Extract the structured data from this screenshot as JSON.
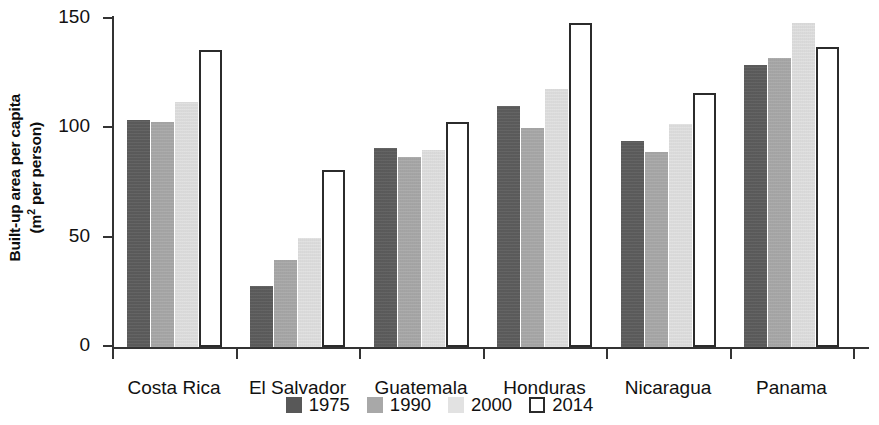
{
  "chart_data": {
    "type": "bar",
    "title": "",
    "subtitle": "",
    "xlabel": "",
    "ylabel": "Built-up area per capita (m² per person)",
    "ylabel_line1": "Built-up area per capita",
    "ylabel_line2_prefix": "(m",
    "ylabel_line2_sup": "2",
    "ylabel_line2_suffix": " per person)",
    "ylim": [
      0,
      150
    ],
    "yticks": [
      0,
      50,
      100,
      150
    ],
    "ytick_labels": [
      "0",
      "50",
      "100",
      "150"
    ],
    "grid": false,
    "legend_position": "bottom-center",
    "categories": [
      "Costa Rica",
      "El Salvador",
      "Guatemala",
      "Honduras",
      "Nicaragua",
      "Panama"
    ],
    "series": [
      {
        "name": "1975",
        "color": "#585858",
        "values": [
          104,
          28,
          91,
          110,
          94,
          129
        ]
      },
      {
        "name": "1990",
        "color": "#a8a8a8",
        "values": [
          103,
          40,
          87,
          100,
          89,
          132
        ]
      },
      {
        "name": "2000",
        "color": "#e2e2e2",
        "values": [
          112,
          50,
          90,
          118,
          102,
          148
        ]
      },
      {
        "name": "2014",
        "color": "#ffffff",
        "values": [
          136,
          81,
          103,
          148,
          116,
          137
        ]
      }
    ]
  },
  "legend": {
    "items": [
      {
        "label": "1975",
        "swatch": "filled-dark"
      },
      {
        "label": "1990",
        "swatch": "filled-mid"
      },
      {
        "label": "2000",
        "swatch": "filled-light"
      },
      {
        "label": "2014",
        "swatch": "outline"
      }
    ]
  }
}
